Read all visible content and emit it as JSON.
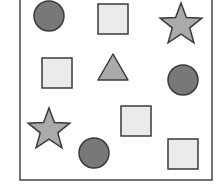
{
  "diagram": {
    "frame": {
      "x": 20,
      "y": -10,
      "width": 192,
      "height": 190,
      "stroke": "#444444"
    },
    "colors": {
      "circle_fill": "#787878",
      "square_fill": "#ebebeb",
      "star_fill": "#aaaaaa",
      "triangle_fill": "#aaaaaa",
      "stroke": "#3a3a3a"
    },
    "shapes": [
      {
        "type": "circle",
        "cx": 49,
        "cy": 16,
        "r": 15
      },
      {
        "type": "square",
        "x": 98,
        "y": 4,
        "size": 30
      },
      {
        "type": "star",
        "cx": 181,
        "cy": 25,
        "r": 22
      },
      {
        "type": "square",
        "x": 42,
        "y": 58,
        "size": 30
      },
      {
        "type": "triangle",
        "cx": 113,
        "top": 54,
        "base": 80,
        "half": 15
      },
      {
        "type": "circle",
        "cx": 183,
        "cy": 80,
        "r": 15
      },
      {
        "type": "star",
        "cx": 49,
        "cy": 130,
        "r": 22
      },
      {
        "type": "square",
        "x": 121,
        "y": 106,
        "size": 30
      },
      {
        "type": "circle",
        "cx": 94,
        "cy": 153,
        "r": 15
      },
      {
        "type": "square",
        "x": 168,
        "y": 139,
        "size": 30
      }
    ]
  }
}
